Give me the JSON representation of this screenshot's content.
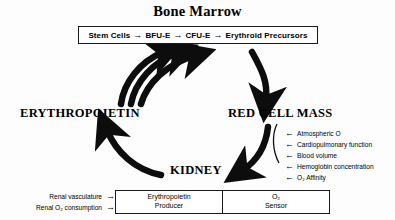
{
  "title": "Bone Marrow",
  "marrow_pathway": {
    "arrow_glyph": "→",
    "steps": [
      "Stem Cells",
      "BFU-E",
      "CFU-E",
      "Erythroid Precursors"
    ]
  },
  "cycle_nodes": {
    "erythropoietin": "ERYTHROPOIETIN",
    "red_cell_mass": "RED CELL MASS",
    "kidney": "KIDNEY"
  },
  "factors": {
    "arrow_glyph": "←",
    "items": [
      "Atmospheric O",
      "Cardiopulmonary function",
      "Blood volume",
      "Hemoglobin concentration",
      "O₂ Affinity"
    ]
  },
  "kidney_box": {
    "producer": {
      "line1": "Erythropoietin",
      "line2": "Producer"
    },
    "sensor": {
      "line1": "O₂",
      "line2": "Sensor"
    }
  },
  "renal_inputs": {
    "arrow_glyph": "→",
    "items": [
      "Renal vasculature",
      "Renal O₂ consumption"
    ]
  },
  "colors": {
    "ink": "#000000",
    "background": "#fdfdfd",
    "box_border": "#1a1a1a"
  }
}
